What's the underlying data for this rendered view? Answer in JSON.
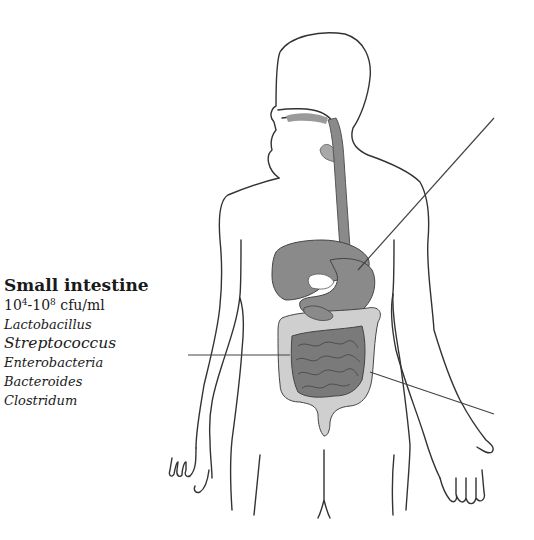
{
  "diagram": {
    "colors": {
      "outline": "#333333",
      "organ_dark": "#8a8a8a",
      "organ_light": "#cfcfcf",
      "small_intestine": "#7a7a7a",
      "leader_line": "#444444",
      "text": "#1a1a1a"
    },
    "annotation": {
      "title": "Small intestine",
      "count_base_low": "10",
      "count_exp_low": "4",
      "count_sep": "-10",
      "count_exp_high": "8",
      "count_unit": " cfu/ml",
      "organisms": [
        "Lactobacillus",
        "Streptococcus",
        "Enterobacteria",
        "Bacteroides",
        "Clostridum"
      ]
    },
    "leader_lines": [
      {
        "name": "stomach-pointer",
        "x1": 494,
        "y1": 118,
        "x2": 358,
        "y2": 270
      },
      {
        "name": "small-intestine-pointer",
        "x1": 188,
        "y1": 355,
        "x2": 290,
        "y2": 355
      },
      {
        "name": "colon-pointer",
        "x1": 370,
        "y1": 372,
        "x2": 494,
        "y2": 414
      }
    ]
  }
}
